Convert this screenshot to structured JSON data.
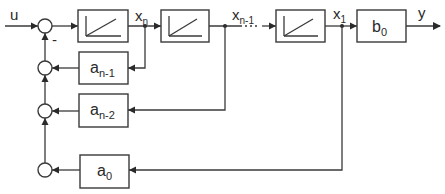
{
  "diagram": {
    "input_label": "u",
    "output_label": "y",
    "minus_sign": "-",
    "integrators": [
      {
        "id": "int-n",
        "icon": "ramp-icon",
        "output_state": {
          "base": "x",
          "sub": "n"
        }
      },
      {
        "id": "int-n-1",
        "icon": "ramp-icon",
        "output_state": {
          "base": "x",
          "sub": "n-1"
        }
      },
      {
        "id": "int-1",
        "icon": "ramp-icon",
        "output_state": {
          "base": "x",
          "sub": "1"
        }
      }
    ],
    "output_gain": {
      "base": "b",
      "sub": "0"
    },
    "feedback_gains": [
      {
        "base": "a",
        "sub": "n-1",
        "from_state": "x_n"
      },
      {
        "base": "a",
        "sub": "n-2",
        "from_state": "x_n-1"
      },
      {
        "base": "a",
        "sub": "0",
        "from_state": "x_1"
      }
    ],
    "ellipsis": "..."
  }
}
